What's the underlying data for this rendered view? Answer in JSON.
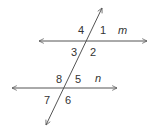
{
  "diagram": {
    "type": "parallel-lines-transversal",
    "lines": {
      "m": {
        "label": "m"
      },
      "n": {
        "label": "n"
      }
    },
    "angles": {
      "a1": "1",
      "a2": "2",
      "a3": "3",
      "a4": "4",
      "a5": "5",
      "a6": "6",
      "a7": "7",
      "a8": "8"
    },
    "colors": {
      "line": "#555555",
      "text": "#333333"
    }
  }
}
